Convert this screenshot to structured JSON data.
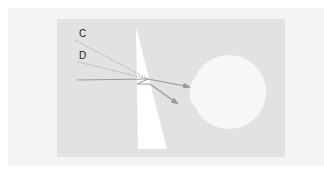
{
  "diagram": {
    "labels": {
      "c": "C",
      "d": "D"
    },
    "colors": {
      "background": "#ffffff",
      "outer_frame": "#f4f4f4",
      "panel": "#e2e2e2",
      "prism": "#ffffff",
      "target": "#f7f7f7",
      "ray": "#999999",
      "dotted_ray": "#aaaaaa"
    },
    "elements": [
      {
        "type": "wedge-prism",
        "description": "White tapered wedge, apex near top"
      },
      {
        "type": "ray",
        "style": "solid",
        "description": "Incoming ray refracted through wedge toward target"
      },
      {
        "type": "ray",
        "style": "solid",
        "description": "Secondary deflected ray with arrow"
      },
      {
        "type": "ray",
        "style": "dotted",
        "label": "C"
      },
      {
        "type": "ray",
        "style": "dotted",
        "label": "D"
      },
      {
        "type": "target",
        "description": "White circular blob on right"
      }
    ]
  }
}
